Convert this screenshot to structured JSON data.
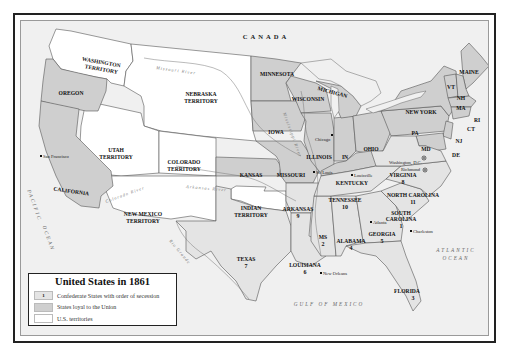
{
  "map": {
    "title": "United States in 1861",
    "colors": {
      "confederate": "#e4e4e4",
      "union": "#cfcfcf",
      "territory": "#ffffff",
      "foreign": "#f0f0f0",
      "border": "#555555",
      "frame": "#222222"
    },
    "legend": {
      "title": "United States in 1861",
      "items": [
        {
          "swatch_label": "1",
          "label": "Confederate States with order of secession",
          "color": "#e4e4e4"
        },
        {
          "swatch_label": "",
          "label": "States loyal to the Union",
          "color": "#cfcfcf"
        },
        {
          "swatch_label": "",
          "label": "U.S. territories",
          "color": "#ffffff"
        }
      ]
    },
    "countries": [
      "CANADA",
      "MEXICO"
    ],
    "water_bodies": [
      "PACIFIC OCEAN",
      "ATLANTIC OCEAN",
      "GULF OF MEXICO"
    ],
    "rivers": [
      "Missouri River",
      "Mississippi River",
      "Colorado River",
      "Arkansas River",
      "Rio Grande"
    ],
    "territories": [
      "WASHINGTON TERRITORY",
      "NEBRASKA TERRITORY",
      "UTAH TERRITORY",
      "COLORADO TERRITORY",
      "NEW MEXICO TERRITORY",
      "INDIAN TERRITORY"
    ],
    "union_states": [
      "OREGON",
      "CALIFORNIA",
      "MINNESOTA",
      "WISCONSIN",
      "MICHIGAN",
      "IOWA",
      "ILLINOIS",
      "IN",
      "OHIO",
      "KANSAS",
      "MISSOURI",
      "KENTUCKY",
      "PA",
      "NEW YORK",
      "MAINE",
      "VT",
      "NH",
      "MA",
      "RI",
      "CT",
      "NJ",
      "DE",
      "MD"
    ],
    "confederate_states": [
      {
        "name": "SOUTH CAROLINA",
        "order": "1"
      },
      {
        "name": "MS",
        "order": "2"
      },
      {
        "name": "FLORIDA",
        "order": "3"
      },
      {
        "name": "ALABAMA",
        "order": "4"
      },
      {
        "name": "GEORGIA",
        "order": "5"
      },
      {
        "name": "LOUISIANA",
        "order": "6"
      },
      {
        "name": "TEXAS",
        "order": "7"
      },
      {
        "name": "VIRGINIA",
        "order": "8"
      },
      {
        "name": "ARKANSAS",
        "order": "9"
      },
      {
        "name": "TENNESSEE",
        "order": "10"
      },
      {
        "name": "NORTH CAROLINA",
        "order": "11"
      }
    ],
    "cities": [
      "San Francisco",
      "Chicago",
      "St. Louis",
      "Louisville",
      "Washington, D.C.",
      "Richmond",
      "Atlanta",
      "Charleston",
      "New Orleans"
    ],
    "labels": {
      "canada": "CANADA",
      "mexico": "MEXICO",
      "pacific_1": "PACIFIC",
      "pacific_2": "OCEAN",
      "atlantic_1": "ATLANTIC",
      "atlantic_2": "OCEAN",
      "gulf": "GULF OF MEXICO",
      "missouri_river": "Missouri River",
      "mississippi_river": "Mississippi River",
      "colorado_river": "Colorado River",
      "arkansas_river": "Arkansas River",
      "rio_grande": "Rio Grande",
      "washington_1": "WASHINGTON",
      "washington_2": "TERRITORY",
      "nebraska_1": "NEBRASKA",
      "nebraska_2": "TERRITORY",
      "utah_1": "UTAH",
      "utah_2": "TERRITORY",
      "colorado_1": "COLORADO",
      "colorado_2": "TERRITORY",
      "newmexico_1": "NEW MEXICO",
      "newmexico_2": "TERRITORY",
      "indian_1": "INDIAN",
      "indian_2": "TERRITORY",
      "oregon": "OREGON",
      "california": "CALIFORNIA",
      "minnesota": "MINNESOTA",
      "wisconsin": "WISCONSIN",
      "michigan": "MICHIGAN",
      "iowa": "IOWA",
      "illinois": "ILLINOIS",
      "indiana": "IN",
      "ohio": "OHIO",
      "kansas": "KANSAS",
      "missouri": "MISSOURI",
      "kentucky": "KENTUCKY",
      "pennsylvania": "PA",
      "newyork": "NEW YORK",
      "maine": "MAINE",
      "vermont": "VT",
      "newhampshire": "NH",
      "massachusetts": "MA",
      "rhodeisland": "RI",
      "connecticut": "CT",
      "newjersey": "NJ",
      "delaware": "DE",
      "maryland": "MD",
      "texas": "TEXAS",
      "texas_n": "7",
      "arkansas": "ARKANSAS",
      "arkansas_n": "9",
      "louisiana": "LOUISIANA",
      "louisiana_n": "6",
      "mississippi": "MS",
      "mississippi_n": "2",
      "alabama": "ALABAMA",
      "alabama_n": "4",
      "georgia": "GEORGIA",
      "georgia_n": "5",
      "florida": "FLORIDA",
      "florida_n": "3",
      "tennessee": "TENNESSEE",
      "tennessee_n": "10",
      "sc_1": "SOUTH",
      "sc_2": "CAROLINA",
      "sc_n": "1",
      "nc": "NORTH CAROLINA",
      "nc_n": "11",
      "virginia": "VIRGINIA",
      "virginia_n": "8",
      "sanfrancisco": "San Francisco",
      "chicago": "Chicago",
      "stlouis": "St. Louis",
      "louisville": "Louisville",
      "washingtondc": "Washington, D.C.",
      "richmond": "Richmond",
      "atlanta": "Atlanta",
      "charleston": "Charleston",
      "neworleans": "New Orleans"
    }
  }
}
